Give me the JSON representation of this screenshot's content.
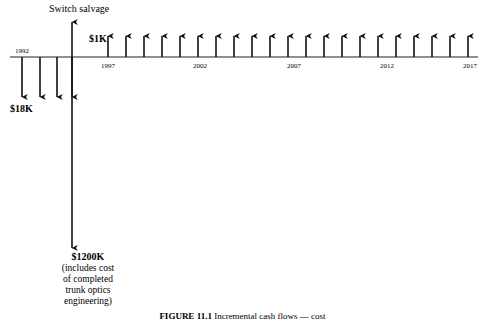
{
  "figure": {
    "caption_prefix": "FIGURE 11.1",
    "caption_text": " Incremental cash flows — cost",
    "axis_color": "#6b6b6b",
    "arrow_color": "#111111"
  },
  "timeline": {
    "axis_y": 57,
    "axis_x_start": 10,
    "axis_x_end": 478,
    "year_ticks": [
      {
        "label": "1992",
        "x": 22,
        "position": "above"
      },
      {
        "label": "1997",
        "x": 108,
        "position": "below"
      },
      {
        "label": "2002",
        "x": 200,
        "position": "below"
      },
      {
        "label": "2007",
        "x": 294,
        "position": "below"
      },
      {
        "label": "2012",
        "x": 387,
        "position": "below"
      },
      {
        "label": "2017",
        "x": 470,
        "position": "below"
      }
    ]
  },
  "outflows": {
    "label": "$18K",
    "label_x": 10,
    "label_y": 112,
    "arrow_xs": [
      22,
      40,
      57,
      72
    ],
    "arrow_top": 57,
    "arrow_bottom": 97
  },
  "major_outflow": {
    "label_lines": [
      "$1200K",
      "(includes cost",
      "of completed",
      "trunk optics",
      "engineering)"
    ],
    "label_center_x": 88,
    "label_start_y": 260,
    "line_height": 11,
    "arrow_x": 72,
    "arrow_top": 57,
    "arrow_bottom": 248
  },
  "salvage": {
    "label": "Switch salvage",
    "label_x": 49,
    "label_y": 12,
    "arrow_x": 72,
    "arrow_top": 22,
    "arrow_bottom": 57
  },
  "inflows": {
    "label": "$1K",
    "label_x": 89,
    "label_y": 42,
    "arrow_top": 36,
    "arrow_bottom": 57,
    "arrow_xs": [
      108,
      126,
      144,
      162,
      180,
      198,
      216,
      234,
      252,
      270,
      288,
      306,
      324,
      342,
      360,
      378,
      396,
      414,
      432,
      450,
      468
    ]
  },
  "chart_data": {
    "type": "bar",
    "xlabel": "Year",
    "ylabel": "Cash flow",
    "categories": [
      "1992",
      "1993",
      "1994",
      "1995",
      "1996",
      "1997",
      "1998",
      "1999",
      "2000",
      "2001",
      "2002",
      "2003",
      "2004",
      "2005",
      "2006",
      "2007",
      "2008",
      "2009",
      "2010",
      "2011",
      "2012",
      "2013",
      "2014",
      "2015",
      "2016",
      "2017"
    ],
    "series": [
      {
        "name": "Annual cost outflow ($18K)",
        "values": [
          -18,
          -18,
          -18,
          -18,
          0,
          0,
          0,
          0,
          0,
          0,
          0,
          0,
          0,
          0,
          0,
          0,
          0,
          0,
          0,
          0,
          0,
          0,
          0,
          0,
          0,
          0
        ]
      },
      {
        "name": "Major outflow ($1200K, includes cost of completed trunk optics engineering)",
        "values": [
          0,
          0,
          0,
          -1200,
          0,
          0,
          0,
          0,
          0,
          0,
          0,
          0,
          0,
          0,
          0,
          0,
          0,
          0,
          0,
          0,
          0,
          0,
          0,
          0,
          0,
          0
        ]
      },
      {
        "name": "Switch salvage",
        "values": [
          0,
          0,
          0,
          1,
          0,
          0,
          0,
          0,
          0,
          0,
          0,
          0,
          0,
          0,
          0,
          0,
          0,
          0,
          0,
          0,
          0,
          0,
          0,
          0,
          0,
          0
        ]
      },
      {
        "name": "Annual benefit inflow ($1K)",
        "values": [
          0,
          0,
          0,
          0,
          0,
          1,
          1,
          1,
          1,
          1,
          1,
          1,
          1,
          1,
          1,
          1,
          1,
          1,
          1,
          1,
          1,
          1,
          1,
          1,
          1,
          1
        ]
      }
    ],
    "tick_labels": [
      "1992",
      "1997",
      "2002",
      "2007",
      "2012",
      "2017"
    ],
    "annotations": [
      "$18K",
      "$1200K",
      "$1K",
      "Switch salvage"
    ],
    "grid": false,
    "legend": "none"
  }
}
